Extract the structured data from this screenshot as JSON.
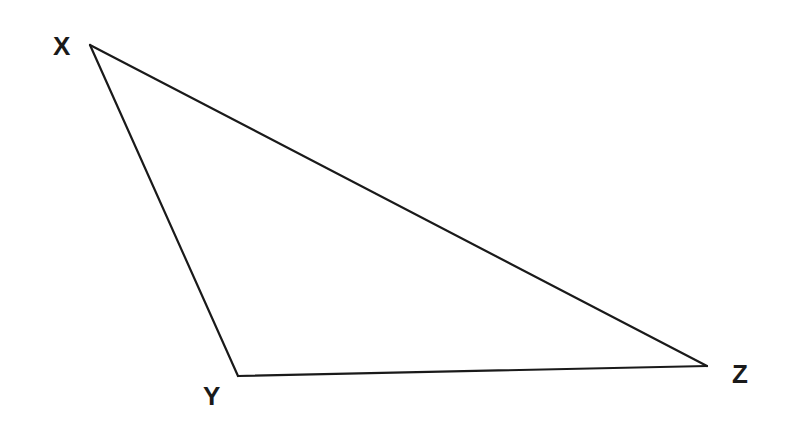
{
  "diagram": {
    "type": "triangle",
    "stroke_color": "#1a1a1a",
    "background": "#ffffff",
    "vertices": [
      {
        "name": "X",
        "x": 90,
        "y": 45,
        "label_x": 53,
        "label_y": 33
      },
      {
        "name": "Y",
        "x": 238,
        "y": 376,
        "label_x": 203,
        "label_y": 383
      },
      {
        "name": "Z",
        "x": 707,
        "y": 366,
        "label_x": 732,
        "label_y": 361
      }
    ],
    "labels": {
      "x": "X",
      "y": "Y",
      "z": "Z"
    }
  }
}
